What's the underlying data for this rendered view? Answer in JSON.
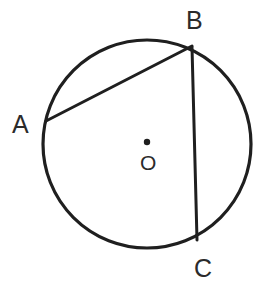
{
  "figure": {
    "background_color": "#ffffff",
    "stroke_color": "#1f1f1f",
    "label_color": "#2b2b2b",
    "canvas": {
      "width": 271,
      "height": 293
    }
  },
  "circle": {
    "name": "main-circle",
    "center": {
      "x": 147,
      "y": 144
    },
    "radius": 104,
    "stroke_width": 3.2
  },
  "center_point": {
    "name": "center-dot",
    "x": 147,
    "y": 142,
    "radius": 3.2,
    "label": "O"
  },
  "points": [
    {
      "id": "A",
      "label": "A",
      "x": 46,
      "y": 121,
      "label_x": 12,
      "label_y": 112
    },
    {
      "id": "B",
      "label": "B",
      "x": 192,
      "y": 46,
      "label_x": 186,
      "label_y": 8
    },
    {
      "id": "C",
      "label": "C",
      "x": 197,
      "y": 240,
      "label_x": 194,
      "label_y": 256
    }
  ],
  "chords": [
    {
      "id": "AB",
      "from": "A",
      "to": "B",
      "x1": 46,
      "y1": 121,
      "x2": 192,
      "y2": 46,
      "stroke_width": 3.0
    },
    {
      "id": "BC",
      "from": "B",
      "to": "C",
      "x1": 192,
      "y1": 47,
      "x2": 197,
      "y2": 240,
      "stroke_width": 3.0
    }
  ],
  "labels": {
    "A": "A",
    "B": "B",
    "C": "C",
    "O": "O"
  }
}
